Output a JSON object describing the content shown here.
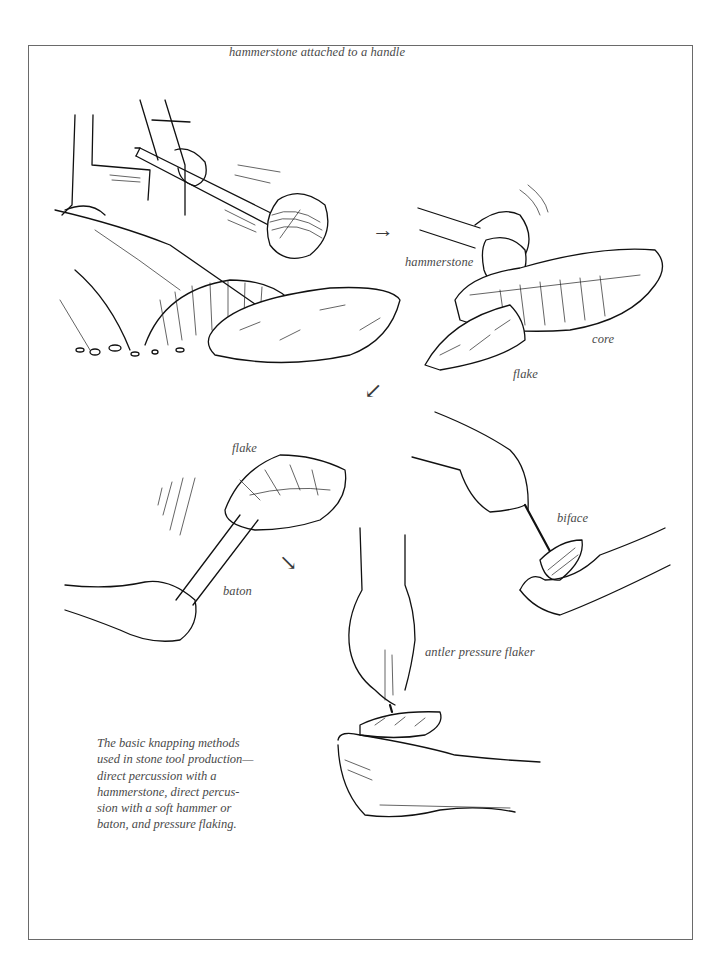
{
  "figure": {
    "labels": {
      "hammerstone_handle": "hammerstone attached to a handle",
      "hammerstone": "hammerstone",
      "core": "core",
      "flake_top": "flake",
      "flake_middle": "flake",
      "baton": "baton",
      "biface": "biface",
      "antler_pressure_flaker": "antler pressure flaker"
    },
    "arrows": {
      "right": "→",
      "down_left": "↙",
      "down_right": "↘"
    },
    "caption": {
      "lines": [
        "The basic knapping methods",
        "used in stone tool production—",
        "direct percussion with a",
        "hammerstone, direct percus-",
        "sion with a soft hammer or",
        "baton, and pressure flaking."
      ]
    },
    "panels": [
      {
        "name": "hafted-hammerstone-on-boulder"
      },
      {
        "name": "hammerstone-striking-core"
      },
      {
        "name": "baton-soft-hammer"
      },
      {
        "name": "pressure-flaking-biface"
      },
      {
        "name": "antler-pressure-flaker"
      }
    ]
  }
}
